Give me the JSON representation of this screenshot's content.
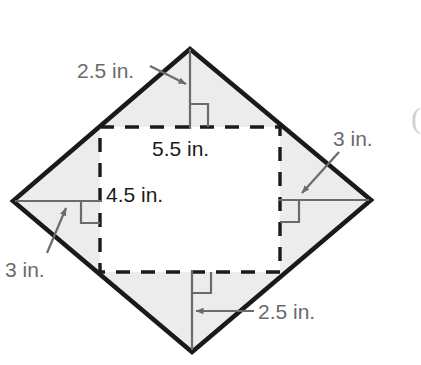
{
  "figure": {
    "colors": {
      "shape_fill": "#ececec",
      "shape_stroke": "#1a1a1a",
      "dashed_stroke": "#1a1a1a",
      "dimension_stroke": "#6b6b6b",
      "outer_label_text": "#6b6b6b",
      "inner_label_text": "#1a1a1a",
      "background": "#ffffff"
    },
    "units": "in.",
    "rhombus": {
      "name": "shaded-rhombus",
      "vertices": {
        "top": [
          190,
          49
        ],
        "right": [
          371,
          200
        ],
        "bottom": [
          192,
          352
        ],
        "left": [
          13,
          201
        ]
      }
    },
    "inner_square": {
      "name": "dashed-square",
      "left": 100,
      "top": 127,
      "right": 280,
      "bottom": 272
    },
    "labels": {
      "top_left": "2.5 in.",
      "top_inner": "5.5 in.",
      "left_inner": "4.5 in.",
      "right": "3 in.",
      "bottom_left": "3 in.",
      "bottom_right": "2.5 in."
    },
    "edge_artifact": "("
  }
}
